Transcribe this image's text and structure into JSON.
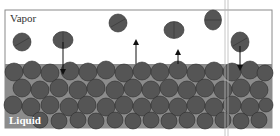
{
  "diagram": {
    "labels": {
      "vapor": "Vapor",
      "liquid": "Liquid"
    },
    "colors": {
      "molecule": "#555555",
      "molecule_edge": "#2e2e2e",
      "liquid_bg": "#8a8a8a",
      "box_border": "#888888",
      "arrow": "#111111"
    },
    "vapor_molecules": [
      {
        "cx": 22,
        "cy": 42
      },
      {
        "cx": 63,
        "cy": 40
      },
      {
        "cx": 118,
        "cy": 23
      },
      {
        "cx": 174,
        "cy": 30
      },
      {
        "cx": 213,
        "cy": 20
      },
      {
        "cx": 240,
        "cy": 42
      }
    ],
    "arrows": [
      {
        "direction": "down",
        "meaning": "condensation",
        "x": 63
      },
      {
        "direction": "up",
        "meaning": "evaporation",
        "x": 136
      },
      {
        "direction": "up",
        "meaning": "evaporation",
        "x": 178
      },
      {
        "direction": "down",
        "meaning": "condensation",
        "x": 240
      }
    ]
  }
}
